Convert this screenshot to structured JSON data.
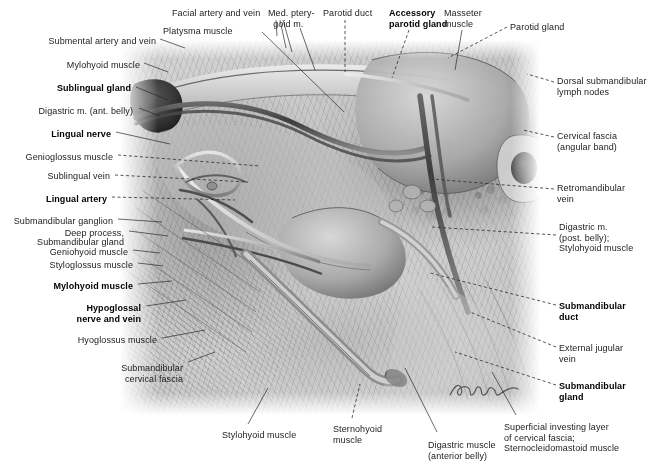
{
  "plate": {
    "title": "Submandibular region — superficial and deep dissection",
    "artist_signature": "signature-mark",
    "background_color": "#ffffff",
    "ink_color": "#1b1b1b"
  },
  "labels": {
    "top": [
      {
        "id": "facial-artery-and-vein",
        "text": "Facial artery and vein",
        "bold": false,
        "x": 172,
        "y": 8,
        "align": "left"
      },
      {
        "id": "med-pterygoid-muscle",
        "text": "Med. ptery-\n  goid m.",
        "bold": false,
        "x": 268,
        "y": 8,
        "align": "left"
      },
      {
        "id": "parotid-duct",
        "text": "Parotid duct",
        "bold": false,
        "x": 323,
        "y": 8,
        "align": "left"
      },
      {
        "id": "accessory-parotid-gland",
        "text": "Accessory\nparotid gland",
        "bold": true,
        "x": 389,
        "y": 8,
        "align": "left"
      },
      {
        "id": "masseter-muscle",
        "text": "Masseter\nmuscle",
        "bold": false,
        "x": 444,
        "y": 8,
        "align": "left"
      },
      {
        "id": "parotid-gland",
        "text": "Parotid gland",
        "bold": false,
        "x": 510,
        "y": 22,
        "align": "left"
      },
      {
        "id": "platysma-muscle",
        "text": "Platysma muscle",
        "bold": false,
        "x": 163,
        "y": 26,
        "align": "left"
      }
    ],
    "left": [
      {
        "id": "submental-artery-and-vein",
        "text": "Submental artery and vein",
        "bold": false,
        "x": 156,
        "y": 36,
        "align": "right"
      },
      {
        "id": "mylohyoid-muscle-upper",
        "text": "Mylohyoid muscle",
        "bold": false,
        "x": 140,
        "y": 60,
        "align": "right"
      },
      {
        "id": "sublingual-gland",
        "text": "Sublingual gland",
        "bold": true,
        "x": 131,
        "y": 83,
        "align": "right"
      },
      {
        "id": "digastric-m-ant-belly",
        "text": "Digastric m. (ant. belly)",
        "bold": false,
        "x": 133,
        "y": 106,
        "align": "right"
      },
      {
        "id": "lingual-nerve",
        "text": "Lingual nerve",
        "bold": true,
        "x": 111,
        "y": 129,
        "align": "right"
      },
      {
        "id": "genioglossus-muscle",
        "text": "Genioglossus muscle",
        "bold": false,
        "x": 113,
        "y": 152,
        "align": "right"
      },
      {
        "id": "sublingual-vein",
        "text": "Sublingual vein",
        "bold": false,
        "x": 110,
        "y": 171,
        "align": "right"
      },
      {
        "id": "lingual-artery",
        "text": "Lingual artery",
        "bold": true,
        "x": 107,
        "y": 194,
        "align": "right"
      },
      {
        "id": "submandibular-ganglion",
        "text": "Submandibular ganglion",
        "bold": false,
        "x": 113,
        "y": 216,
        "align": "right"
      },
      {
        "id": "deep-process",
        "text": "Deep process,",
        "bold": false,
        "x": 124,
        "y": 228,
        "align": "right"
      },
      {
        "id": "submandibular-gland-left",
        "text": "Submandibular gland",
        "bold": false,
        "x": 124,
        "y": 237,
        "align": "right"
      },
      {
        "id": "geniohyoid-muscle",
        "text": "Geniohyoid muscle",
        "bold": false,
        "x": 128,
        "y": 247,
        "align": "right"
      },
      {
        "id": "styloglossus-muscle",
        "text": "Styloglossus muscle",
        "bold": false,
        "x": 133,
        "y": 260,
        "align": "right"
      },
      {
        "id": "mylohyoid-muscle-bold",
        "text": "Mylohyoid muscle",
        "bold": true,
        "x": 133,
        "y": 281,
        "align": "right"
      },
      {
        "id": "hypoglossal-nerve-and-vein",
        "text": "Hypoglossal\nnerve and vein",
        "bold": true,
        "x": 141,
        "y": 303,
        "align": "right"
      },
      {
        "id": "hyoglossus-muscle",
        "text": "Hyoglossus muscle",
        "bold": false,
        "x": 157,
        "y": 335,
        "align": "right"
      },
      {
        "id": "submandibular-cervical-fascia",
        "text": "Submandibular\ncervical fascia",
        "bold": false,
        "x": 183,
        "y": 363,
        "align": "right"
      }
    ],
    "right": [
      {
        "id": "dorsal-submandibular-lymph-nodes",
        "text": "Dorsal submandibular\nlymph nodes",
        "bold": false,
        "x": 557,
        "y": 76,
        "align": "left"
      },
      {
        "id": "cervical-fascia-angular-band",
        "text": "Cervical fascia\n(angular band)",
        "bold": false,
        "x": 557,
        "y": 131,
        "align": "left"
      },
      {
        "id": "retromandibular-vein",
        "text": "Retromandibular\nvein",
        "bold": false,
        "x": 557,
        "y": 183,
        "align": "left"
      },
      {
        "id": "digastric-post-belly-stylohyoid",
        "text": "Digastric m.\n(post. belly);\nStylohyoid muscle",
        "bold": false,
        "x": 559,
        "y": 222,
        "align": "left"
      },
      {
        "id": "submandibular-duct",
        "text": "Submandibular\nduct",
        "bold": true,
        "x": 559,
        "y": 301,
        "align": "left"
      },
      {
        "id": "external-jugular-vein",
        "text": "External jugular\nvein",
        "bold": false,
        "x": 559,
        "y": 343,
        "align": "left"
      },
      {
        "id": "submandibular-gland-right",
        "text": "Submandibular\ngland",
        "bold": true,
        "x": 559,
        "y": 381,
        "align": "left"
      }
    ],
    "bottom": [
      {
        "id": "stylohyoid-muscle",
        "text": "Stylohyoid muscle",
        "bold": false,
        "x": 222,
        "y": 430,
        "align": "left"
      },
      {
        "id": "sternohyoid-muscle",
        "text": "Sternohyoid\nmuscle",
        "bold": false,
        "x": 333,
        "y": 424,
        "align": "left"
      },
      {
        "id": "digastric-muscle-ant-belly",
        "text": "Digastric muscle\n(anterior belly)",
        "bold": false,
        "x": 428,
        "y": 440,
        "align": "left"
      },
      {
        "id": "superficial-investing-layer",
        "text": "Superficial investing layer\nof cervical fascia;\nSternocleidomastoid muscle",
        "bold": false,
        "x": 504,
        "y": 422,
        "align": "left"
      }
    ]
  },
  "leaders": [
    {
      "id": "leader-facial-artery-and-vein",
      "d": "M 276 20 L 277 36 M 280 20 L 286 48 M 283 20 L 292 52",
      "style": "solid"
    },
    {
      "id": "leader-med-pterygoid-muscle",
      "d": "M 300 28 L 315 70",
      "style": "solid"
    },
    {
      "id": "leader-parotid-duct",
      "d": "M 345 20 L 345 72",
      "style": "dash"
    },
    {
      "id": "leader-accessory-parotid-gland",
      "d": "M 409 30 L 392 78",
      "style": "dash"
    },
    {
      "id": "leader-masseter-muscle",
      "d": "M 462 30 L 455 70",
      "style": "solid"
    },
    {
      "id": "leader-parotid-gland",
      "d": "M 507 27 L 448 58",
      "style": "dash"
    },
    {
      "id": "leader-platysma-muscle",
      "d": "M 262 32 L 344 112",
      "style": "solid"
    },
    {
      "id": "leader-submental-artery-and-vein",
      "d": "M 160 39 L 185 48",
      "style": "solid"
    },
    {
      "id": "leader-mylohyoid-muscle-upper",
      "d": "M 144 63 L 168 72",
      "style": "solid"
    },
    {
      "id": "leader-sublingual-gland",
      "d": "M 136 87 L 168 100",
      "style": "solid"
    },
    {
      "id": "leader-digastric-m-ant-belly",
      "d": "M 139 108 L 160 116",
      "style": "solid"
    },
    {
      "id": "leader-lingual-nerve",
      "d": "M 116 132 L 170 144",
      "style": "solid"
    },
    {
      "id": "leader-genioglossus-muscle",
      "d": "M 118 155 L 260 166",
      "style": "dash"
    },
    {
      "id": "leader-sublingual-vein",
      "d": "M 115 175 L 248 182",
      "style": "dash"
    },
    {
      "id": "leader-lingual-artery",
      "d": "M 112 197 L 235 200",
      "style": "dash"
    },
    {
      "id": "leader-submandibular-ganglion",
      "d": "M 118 219 L 162 222",
      "style": "solid"
    },
    {
      "id": "leader-deep-process",
      "d": "M 129 231 L 168 236",
      "style": "solid"
    },
    {
      "id": "leader-geniohyoid-muscle",
      "d": "M 133 250 L 160 253",
      "style": "solid"
    },
    {
      "id": "leader-styloglossus-muscle",
      "d": "M 138 263 L 163 266",
      "style": "solid"
    },
    {
      "id": "leader-mylohyoid-muscle-bold",
      "d": "M 138 284 L 172 281",
      "style": "solid"
    },
    {
      "id": "leader-hypoglossal-nerve-and-vein",
      "d": "M 146 306 L 186 300",
      "style": "solid"
    },
    {
      "id": "leader-hyoglossus-muscle",
      "d": "M 162 338 L 205 330",
      "style": "solid"
    },
    {
      "id": "leader-submandibular-cervical-fascia",
      "d": "M 188 362 L 215 352",
      "style": "solid"
    },
    {
      "id": "leader-dorsal-submandibular-lymph-nodes",
      "d": "M 554 82 L 527 74",
      "style": "dash"
    },
    {
      "id": "leader-cervical-fascia-angular-band",
      "d": "M 554 137 L 523 130",
      "style": "dash"
    },
    {
      "id": "leader-retromandibular-vein",
      "d": "M 554 189 L 432 179",
      "style": "dash"
    },
    {
      "id": "leader-digastric-post-belly",
      "d": "M 556 235 L 432 227",
      "style": "dash"
    },
    {
      "id": "leader-submandibular-duct",
      "d": "M 556 305 L 430 273",
      "style": "dash"
    },
    {
      "id": "leader-external-jugular-vein",
      "d": "M 556 347 L 470 312",
      "style": "dash"
    },
    {
      "id": "leader-submandibular-gland-right",
      "d": "M 556 385 L 455 352",
      "style": "dash"
    },
    {
      "id": "leader-stylohyoid-muscle",
      "d": "M 248 424 L 268 388",
      "style": "solid"
    },
    {
      "id": "leader-sternohyoid-muscle",
      "d": "M 352 418 L 360 384",
      "style": "dash"
    },
    {
      "id": "leader-digastric-muscle-ant-belly",
      "d": "M 437 432 L 405 368",
      "style": "solid"
    },
    {
      "id": "leader-superficial-investing-layer",
      "d": "M 516 415 L 492 372",
      "style": "solid"
    }
  ]
}
